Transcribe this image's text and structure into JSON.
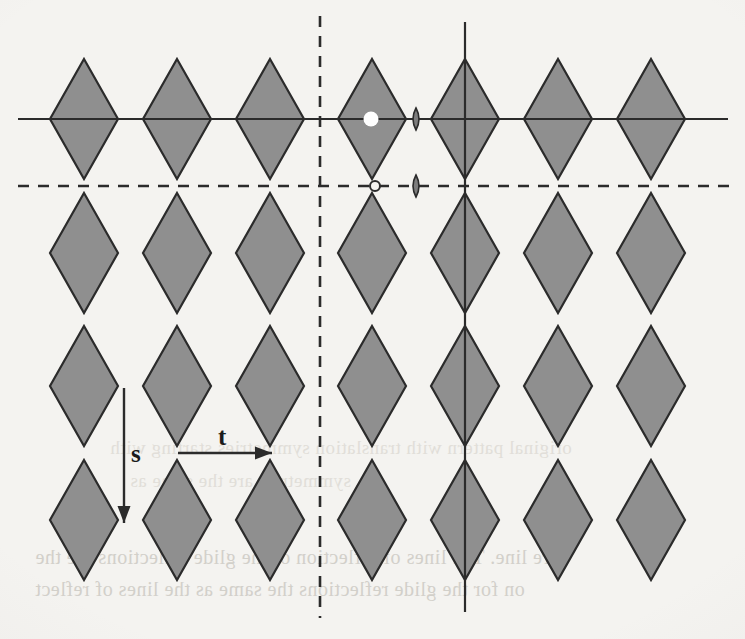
{
  "figure": {
    "kind": "rhombus-tiling-symmetry-diagram",
    "background_color": "#f4f3f0",
    "rhombus_fill": "#8f8f8f",
    "rhombus_stroke": "#2b2b2b",
    "line_color": "#2b2b2b",
    "labels": [
      {
        "id": "s",
        "text": "s",
        "x": 131,
        "y": 440,
        "meaning": "vertical-translation-vector"
      },
      {
        "id": "t",
        "text": "t",
        "x": 218,
        "y": 423,
        "meaning": "horizontal-translation-vector"
      }
    ],
    "rhombi": {
      "half_width": 34,
      "half_height": 60,
      "column_centers": [
        84,
        177,
        270,
        372,
        465,
        558,
        651
      ],
      "row_centers": [
        119,
        253,
        386,
        520
      ],
      "column_pitch": 93,
      "row_pitch": 134,
      "count_columns": 7,
      "count_rows": 4
    },
    "axes": {
      "solid_horizontal": {
        "y": 119,
        "x1": 18,
        "x2": 728,
        "style": "solid"
      },
      "dashed_horizontal": {
        "y": 186,
        "x1": 18,
        "x2": 733,
        "style": "dashed"
      },
      "solid_vertical": {
        "x": 465,
        "y1": 22,
        "y2": 612,
        "style": "solid"
      },
      "dashed_vertical": {
        "x": 320,
        "y1": 16,
        "y2": 618,
        "style": "dashed"
      }
    },
    "markers": [
      {
        "id": "filled-circle",
        "shape": "circle",
        "fill": "#ffffff",
        "stroke": "none",
        "x": 371,
        "y": 119,
        "r": 7.5
      },
      {
        "id": "hollow-circle",
        "shape": "circle",
        "fill": "#f4f3f0",
        "stroke": "#2b2b2b",
        "x": 375,
        "y": 186,
        "r": 5
      },
      {
        "id": "lens-upper",
        "shape": "lens",
        "fill": "#7d7d7d",
        "stroke": "#2b2b2b",
        "x": 416,
        "y": 119,
        "rx": 6,
        "ry": 11
      },
      {
        "id": "lens-lower",
        "shape": "lens",
        "fill": "#7d7d7d",
        "stroke": "#2b2b2b",
        "x": 416,
        "y": 186,
        "rx": 6,
        "ry": 11
      }
    ],
    "arrows": {
      "s_arrow": {
        "x1": 124,
        "y1": 388,
        "x2": 124,
        "y2": 523,
        "direction": "down"
      },
      "t_arrow": {
        "x1": 178,
        "y1": 453,
        "x2": 272,
        "y2": 453,
        "direction": "right"
      }
    }
  },
  "bleed_text": {
    "note": "faint mirror-image show-through from the reverse side of the scanned page",
    "lines": [
      {
        "text": "original pattern with translation symmetries starting with",
        "x": 110,
        "y": 437,
        "size": 19,
        "class": "bleed faint"
      },
      {
        "text": "symmetries are the same as",
        "x": 130,
        "y": 470,
        "size": 19,
        "class": "bleed faint"
      },
      {
        "text": "re  line. The lines of reflection of the glide reflections are the",
        "x": 35,
        "y": 546,
        "size": 20,
        "class": "bleed"
      },
      {
        "text": "on for the glide reflections the same as the lines of reflect",
        "x": 35,
        "y": 578,
        "size": 20,
        "class": "bleed"
      }
    ]
  }
}
